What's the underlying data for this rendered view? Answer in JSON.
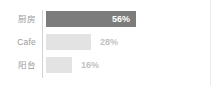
{
  "chart_data": {
    "type": "bar",
    "orientation": "horizontal",
    "title": "",
    "xlabel": "",
    "ylabel": "",
    "xlim": [
      0,
      100
    ],
    "grid": false,
    "legend": null,
    "value_suffix": "%",
    "categories": [
      "厨房",
      "Cafe",
      "阳台"
    ],
    "values": [
      56,
      28,
      16
    ],
    "bars": [
      {
        "category": "厨房",
        "value": 56,
        "value_label": "56%",
        "highlighted": true,
        "label_position": "inside",
        "bar_color": "#7c7c7c",
        "value_color": "#ffffff"
      },
      {
        "category": "Cafe",
        "value": 28,
        "value_label": "28%",
        "highlighted": false,
        "label_position": "outside",
        "bar_color": "#e3e3e3",
        "value_color": "#c2c2c2"
      },
      {
        "category": "阳台",
        "value": 16,
        "value_label": "16%",
        "highlighted": false,
        "label_position": "outside",
        "bar_color": "#e3e3e3",
        "value_color": "#c2c2c2"
      }
    ]
  },
  "style": {
    "background": "#ffffff",
    "axis_color": "#d2d2d2",
    "edge_rule_color": "#ececec",
    "category_label_color": "#9a9a9a",
    "bar_track_color": "#ffffff",
    "accent_color": "#7c7c7c",
    "muted_bar_color": "#e3e3e3"
  }
}
